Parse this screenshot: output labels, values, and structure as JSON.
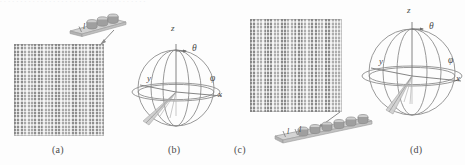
{
  "figure": {
    "width": 465,
    "height": 165,
    "background": "#fdfdfd",
    "ink": "#6a6a6a",
    "scan_artifact_text": ". .  . . . . . . . . . . . . . .   .    . .  . . . . . . . . . . . . . . . . ."
  },
  "panels": [
    {
      "id": "a",
      "caption": "(a)",
      "kind": "planar-array",
      "element_label": "l",
      "strip_elements": 3,
      "grid_rows": 20,
      "grid_cols": 20
    },
    {
      "id": "b",
      "caption": "(b)",
      "kind": "coordinate-sphere",
      "axes": {
        "z": "z",
        "x": "x",
        "y": "y",
        "theta": "θ",
        "phi": "φ"
      }
    },
    {
      "id": "c",
      "caption": "(c)",
      "kind": "planar-array",
      "element_label": "l",
      "strip_elements": 6,
      "grid_rows": 22,
      "grid_cols": 22
    },
    {
      "id": "d",
      "caption": "(d)",
      "kind": "coordinate-sphere",
      "axes": {
        "z": "z",
        "x": "x",
        "y": "y",
        "theta": "θ",
        "phi": "φ"
      }
    }
  ]
}
